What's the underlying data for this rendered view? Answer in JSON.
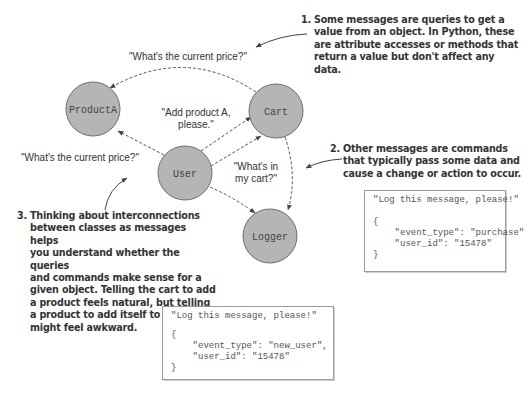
{
  "nodes": [
    {
      "id": "producta",
      "label": "ProductA"
    },
    {
      "id": "cart",
      "label": "Cart"
    },
    {
      "id": "user",
      "label": "User"
    },
    {
      "id": "logger",
      "label": "Logger"
    }
  ],
  "messages": {
    "cart_to_product_price": "\"What's the current price?\"",
    "user_to_product_price": "\"What's the current price?\"",
    "user_to_cart_add_line1": "\"Add product A,",
    "user_to_cart_add_line2": "please.\"",
    "user_to_cart_whats_line1": "\"What's in",
    "user_to_cart_whats_line2": "my cart?\""
  },
  "annotations": [
    {
      "number": "1.",
      "lines": [
        "Some messages are queries to get a",
        "value from an object. In Python, these",
        "are attribute accesses or methods that",
        "return a value but don't affect any data."
      ]
    },
    {
      "number": "2.",
      "lines": [
        "Other messages are commands",
        "that typically pass some data and",
        "cause a change or action to occur."
      ]
    },
    {
      "number": "3.",
      "lines": [
        "Thinking about interconnections",
        "between classes as messages helps",
        "you understand whether the queries",
        "and commands make sense for a",
        "given object. Telling the cart to add",
        "a product feels natural, but telling",
        "a product to add itself to the cart",
        "might feel awkward."
      ]
    }
  ],
  "code_boxes": [
    {
      "id": "purchase",
      "lines": [
        "\"Log this message, please!\"",
        "",
        "{",
        "    \"event_type\": \"purchase\",",
        "    \"user_id\": \"15478\"",
        "}"
      ]
    },
    {
      "id": "new_user",
      "lines": [
        "\"Log this message, please!\"",
        "",
        "{",
        "    \"event_type\": \"new_user\",",
        "    \"user_id\": \"15478\"",
        "}"
      ]
    }
  ],
  "colors": {
    "node_fill": "#b5b5b5",
    "node_stroke": "#6e6e6e",
    "edge": "#555555",
    "text": "#333333"
  }
}
